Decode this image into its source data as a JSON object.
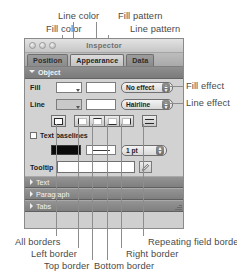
{
  "window": {
    "title": "Inspector",
    "traffic_lights": [
      "close",
      "minimize",
      "zoom"
    ]
  },
  "tabs": [
    {
      "label": "Position",
      "selected": false
    },
    {
      "label": "Appearance",
      "selected": true
    },
    {
      "label": "Data",
      "selected": false
    }
  ],
  "object_section": {
    "label": "Object",
    "expanded": true
  },
  "fill_row": {
    "label": "Fill",
    "color_swatch": "white",
    "pattern_swatch": "white",
    "effect_value": "No effect"
  },
  "line_row": {
    "label": "Line",
    "color_swatch": "gray",
    "pattern_swatch": "white",
    "effect_value": "Hairline"
  },
  "border_buttons": [
    {
      "name": "all-borders",
      "icon": "all"
    },
    {
      "name": "left-border",
      "icon": "left"
    },
    {
      "name": "top-border",
      "icon": "top"
    },
    {
      "name": "bottom-border",
      "icon": "bottom"
    },
    {
      "name": "right-border",
      "icon": "right"
    },
    {
      "name": "repeating-field-border",
      "icon": "rep"
    }
  ],
  "text_baselines": {
    "label": "Text baselines",
    "checked": false
  },
  "line_style_row": {
    "color_swatch": "#0b0b0b",
    "pattern_swatch": "solid",
    "width_value": "1 pt"
  },
  "tooltip_row": {
    "label": "Tooltip",
    "value": "",
    "placeholder": "",
    "edit_icon": "pencil-icon"
  },
  "collapsed_sections": [
    {
      "label": "Text"
    },
    {
      "label": "Paragraph"
    },
    {
      "label": "Tabs"
    }
  ],
  "annotations": {
    "top": [
      {
        "text": "Line color"
      },
      {
        "text": "Fill pattern"
      },
      {
        "text": "Fill color"
      },
      {
        "text": "Line pattern"
      }
    ],
    "right": [
      {
        "text": "Fill effect"
      },
      {
        "text": "Line effect"
      }
    ],
    "bottom": [
      {
        "text": "All borders"
      },
      {
        "text": "Repeating field border"
      },
      {
        "text": "Left border"
      },
      {
        "text": "Right border"
      },
      {
        "text": "Top border"
      },
      {
        "text": "Bottom border"
      }
    ]
  },
  "colors": {
    "annotation_text": "#4a4a4a",
    "leader_line": "#8d8d8d",
    "panel_bg": "#d2d2d2",
    "section_header": "#7f7f7f"
  }
}
